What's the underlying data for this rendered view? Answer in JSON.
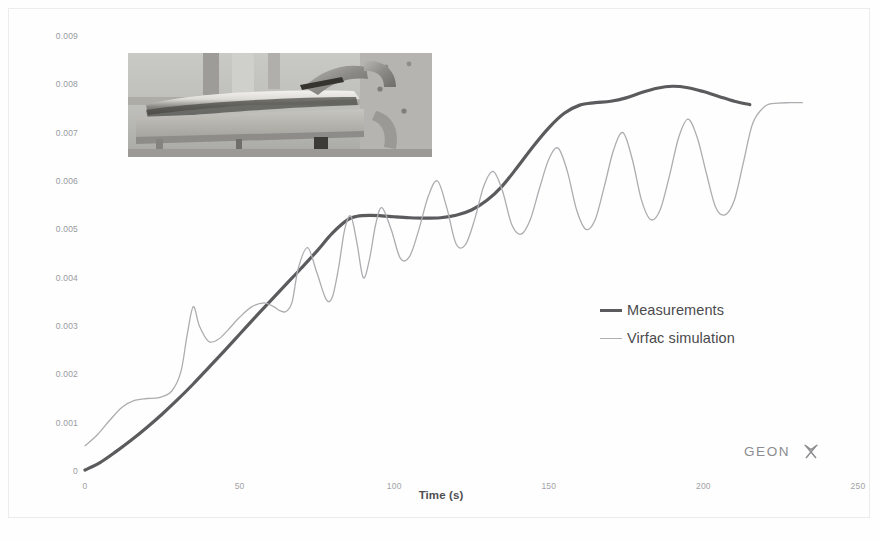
{
  "figure": {
    "background_color": "#fefefe",
    "frame_color": "#ececed"
  },
  "axes": {
    "y_title": "Z Displacement (m)",
    "x_title": "Time (s)",
    "y_ticks": [
      "0",
      "0.001",
      "0.002",
      "0.003",
      "0.004",
      "0.005",
      "0.006",
      "0.007",
      "0.008",
      "0.009"
    ],
    "x_ticks": [
      "0",
      "50",
      "100",
      "150",
      "200",
      "250"
    ],
    "tick_label_color": "#9a9a9e",
    "title_color": "#58585b"
  },
  "legend": {
    "position": "inside-right",
    "entries": [
      {
        "label": "Measurements",
        "color": "#5b5b5e",
        "line_width": 3.2
      },
      {
        "label": "Virfac simulation",
        "color": "#adadb1",
        "line_width": 1.3
      }
    ]
  },
  "branding": {
    "wordmark": "GEONX",
    "color": "#8c8c90"
  },
  "inset": {
    "name": "welded-plate-clamp-photo",
    "caption": "",
    "description": "grayscale photograph of a welded metal plate held by a clamp on a fixture table"
  },
  "chart_data": {
    "type": "line",
    "title": "",
    "xlabel": "Time (s)",
    "ylabel": "Z Displacement (m)",
    "xlim": [
      0,
      250
    ],
    "ylim": [
      0,
      0.009
    ],
    "xticks": [
      0,
      50,
      100,
      150,
      200,
      250
    ],
    "yticks": [
      0,
      0.001,
      0.002,
      0.003,
      0.004,
      0.005,
      0.006,
      0.007,
      0.008,
      0.009
    ],
    "grid": false,
    "legend_position": "inside-right",
    "series": [
      {
        "name": "Measurements",
        "color": "#5b5b5e",
        "line_width": 3.2,
        "x": [
          0,
          5,
          10,
          15,
          20,
          25,
          30,
          35,
          40,
          45,
          50,
          55,
          60,
          65,
          70,
          75,
          80,
          85,
          88,
          92,
          96,
          100,
          105,
          110,
          115,
          120,
          125,
          130,
          135,
          140,
          145,
          150,
          155,
          160,
          165,
          170,
          175,
          180,
          185,
          190,
          195,
          200,
          205,
          210,
          215
        ],
        "y": [
          2e-05,
          0.00018,
          0.0004,
          0.00064,
          0.0009,
          0.00118,
          0.00148,
          0.0018,
          0.00214,
          0.00248,
          0.00283,
          0.00318,
          0.00352,
          0.00386,
          0.0042,
          0.00455,
          0.00492,
          0.0052,
          0.00527,
          0.00529,
          0.00528,
          0.00526,
          0.00524,
          0.00523,
          0.00524,
          0.00529,
          0.0054,
          0.0056,
          0.0059,
          0.0063,
          0.00672,
          0.0071,
          0.0074,
          0.00757,
          0.00762,
          0.00765,
          0.00772,
          0.00783,
          0.00792,
          0.00796,
          0.00793,
          0.00785,
          0.00775,
          0.00765,
          0.00758
        ]
      },
      {
        "name": "Virfac simulation",
        "color": "#adadb1",
        "line_width": 1.3,
        "x": [
          0,
          4,
          8,
          12,
          16,
          20,
          24,
          28,
          31,
          33,
          35,
          37,
          40,
          43,
          46,
          50,
          54,
          58,
          61,
          63,
          65,
          67,
          69,
          72,
          75,
          78,
          80,
          82,
          84,
          86,
          88,
          90,
          92,
          94,
          96,
          99,
          102,
          105,
          108,
          111,
          114,
          117,
          120,
          123,
          126,
          129,
          132,
          135,
          138,
          141,
          144,
          147,
          150,
          153,
          156,
          159,
          162,
          165,
          168,
          171,
          174,
          177,
          180,
          183,
          186,
          189,
          192,
          195,
          198,
          201,
          204,
          207,
          210,
          213,
          216,
          220,
          224,
          228,
          232
        ],
        "y": [
          0.00052,
          0.00075,
          0.00105,
          0.00132,
          0.00146,
          0.0015,
          0.00152,
          0.00165,
          0.00205,
          0.0028,
          0.0034,
          0.003,
          0.00268,
          0.00272,
          0.0029,
          0.00318,
          0.0034,
          0.00348,
          0.0034,
          0.00332,
          0.0033,
          0.0035,
          0.0042,
          0.00462,
          0.0041,
          0.00355,
          0.0036,
          0.0042,
          0.005,
          0.00527,
          0.0047,
          0.004,
          0.00438,
          0.0051,
          0.00545,
          0.005,
          0.0044,
          0.00444,
          0.005,
          0.00568,
          0.006,
          0.00545,
          0.0047,
          0.00468,
          0.0052,
          0.0059,
          0.0062,
          0.0058,
          0.0051,
          0.0049,
          0.0052,
          0.00585,
          0.00645,
          0.00668,
          0.0062,
          0.0054,
          0.005,
          0.0052,
          0.0059,
          0.00665,
          0.007,
          0.00645,
          0.0056,
          0.0052,
          0.0054,
          0.0061,
          0.0069,
          0.00728,
          0.0069,
          0.00615,
          0.00545,
          0.0053,
          0.0056,
          0.0064,
          0.0072,
          0.00755,
          0.00761,
          0.00762,
          0.00762
        ]
      }
    ]
  }
}
